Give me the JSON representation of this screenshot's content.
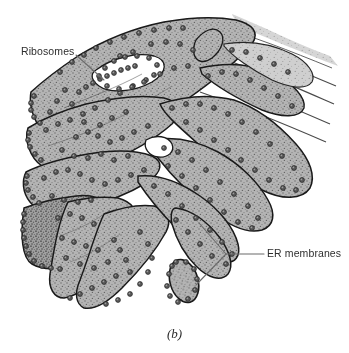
{
  "figure": {
    "caption": "(b)",
    "style": "stippled pen-and-ink scientific illustration",
    "background_color": "#ffffff",
    "ink_color": "#1a1a1a",
    "membrane_fill_color": "#a9a9a9",
    "ribosome_color": "#4a4a4a",
    "leader_line_color": "#6b6b6b"
  },
  "labels": [
    {
      "id": "ribosomes",
      "text": "Ribosomes",
      "x": 21,
      "y": 46,
      "leader": {
        "from_x": 76,
        "from_y": 55,
        "to_x": 104,
        "to_y": 80,
        "branches": 1
      }
    },
    {
      "id": "er-membranes",
      "text": "ER membranes",
      "x": 267,
      "y": 248,
      "leader": {
        "from_x": 264,
        "from_y": 254,
        "vertex_x": 226,
        "vertex_y": 254,
        "to_x": 199,
        "to_y": 223,
        "to2_x": 196,
        "to2_y": 285,
        "branches": 2
      }
    }
  ],
  "structures": {
    "cisternae_stacks": "flattened membrane sheets stacked at left",
    "tubules": "branching curved membrane channels across center",
    "vesicle": "rounded membrane tube end at lower center",
    "fade_region": "thin parallel membrane lines fading out at upper right"
  }
}
